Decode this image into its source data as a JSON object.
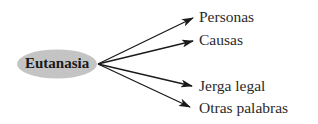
{
  "diagram": {
    "center": {
      "label": "Eutanasia",
      "fill": "#c4c4c4"
    },
    "branches": [
      {
        "label": "Personas"
      },
      {
        "label": "Causas"
      },
      {
        "label": "Jerga legal"
      },
      {
        "label": "Otras palabras"
      }
    ],
    "arrow_color": "#1a1a1a"
  }
}
